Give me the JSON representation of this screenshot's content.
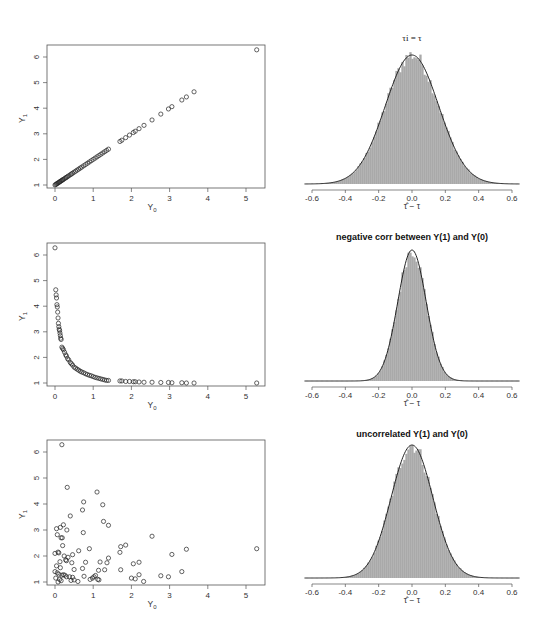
{
  "chart_data": [
    {
      "id": "scatter-identical",
      "type": "scatter",
      "title": "",
      "xlabel": "Y0",
      "ylabel": "Y1",
      "xlim": [
        -0.2,
        5.5
      ],
      "ylim": [
        0.85,
        6.4
      ],
      "xticks": [
        0,
        1,
        2,
        3,
        4,
        5
      ],
      "yticks": [
        1,
        2,
        3,
        4,
        5,
        6
      ],
      "relation": "Y1 = Y0 + 1",
      "x": [
        0.0,
        0.02,
        0.04,
        0.06,
        0.08,
        0.1,
        0.12,
        0.14,
        0.16,
        0.18,
        0.2,
        0.22,
        0.25,
        0.28,
        0.3,
        0.33,
        0.36,
        0.4,
        0.43,
        0.46,
        0.5,
        0.54,
        0.58,
        0.62,
        0.66,
        0.7,
        0.75,
        0.8,
        0.85,
        0.9,
        0.95,
        1.0,
        1.05,
        1.1,
        1.15,
        1.2,
        1.25,
        1.3,
        1.35,
        1.4,
        1.7,
        1.75,
        1.85,
        1.95,
        2.05,
        2.1,
        2.2,
        2.33,
        2.54,
        2.77,
        2.97,
        3.06,
        3.32,
        3.44,
        3.64,
        5.28
      ],
      "y": [
        1.0,
        1.02,
        1.04,
        1.06,
        1.08,
        1.1,
        1.12,
        1.14,
        1.16,
        1.18,
        1.2,
        1.22,
        1.25,
        1.28,
        1.3,
        1.33,
        1.36,
        1.4,
        1.43,
        1.46,
        1.5,
        1.54,
        1.58,
        1.62,
        1.66,
        1.7,
        1.75,
        1.8,
        1.85,
        1.9,
        1.95,
        2.0,
        2.05,
        2.1,
        2.15,
        2.2,
        2.25,
        2.3,
        2.35,
        2.4,
        2.7,
        2.75,
        2.85,
        2.95,
        3.05,
        3.1,
        3.2,
        3.33,
        3.54,
        3.77,
        3.97,
        4.06,
        4.32,
        4.44,
        4.64,
        6.28
      ]
    },
    {
      "id": "hist-identical",
      "type": "histogram",
      "title": "τi = τ",
      "xlabel": "τ̂ − τ",
      "ylabel": "",
      "xlim": [
        -0.65,
        0.65
      ],
      "xticks": [
        -0.6,
        -0.4,
        -0.2,
        0.0,
        0.2,
        0.4,
        0.6
      ],
      "overlay": "normal density curve",
      "mean": 0.0,
      "sd": 0.16
    },
    {
      "id": "scatter-negative",
      "type": "scatter",
      "title": "",
      "xlabel": "Y0",
      "ylabel": "Y1",
      "xlim": [
        -0.2,
        5.5
      ],
      "ylim": [
        0.85,
        6.4
      ],
      "xticks": [
        0,
        1,
        2,
        3,
        4,
        5
      ],
      "yticks": [
        1,
        2,
        3,
        4,
        5,
        6
      ],
      "relation": "decreasing (inverse-type) relationship",
      "x": [
        0.0,
        0.02,
        0.03,
        0.04,
        0.05,
        0.06,
        0.07,
        0.08,
        0.09,
        0.1,
        0.11,
        0.12,
        0.13,
        0.14,
        0.15,
        0.16,
        0.18,
        0.2,
        0.22,
        0.25,
        0.28,
        0.3,
        0.33,
        0.36,
        0.4,
        0.43,
        0.46,
        0.5,
        0.54,
        0.58,
        0.62,
        0.66,
        0.7,
        0.75,
        0.8,
        0.85,
        0.9,
        0.95,
        1.0,
        1.05,
        1.1,
        1.15,
        1.2,
        1.25,
        1.3,
        1.35,
        1.4,
        1.7,
        1.75,
        1.85,
        1.95,
        2.05,
        2.1,
        2.2,
        2.33,
        2.54,
        2.77,
        2.97,
        3.06,
        3.32,
        3.44,
        3.64,
        5.28
      ],
      "y": [
        6.28,
        4.64,
        4.44,
        4.32,
        4.06,
        3.97,
        3.77,
        3.54,
        3.33,
        3.2,
        3.1,
        3.05,
        2.95,
        2.85,
        2.75,
        2.7,
        2.4,
        2.35,
        2.3,
        2.2,
        2.1,
        2.05,
        1.95,
        1.9,
        1.8,
        1.75,
        1.7,
        1.62,
        1.58,
        1.54,
        1.5,
        1.46,
        1.43,
        1.4,
        1.36,
        1.33,
        1.3,
        1.28,
        1.25,
        1.22,
        1.2,
        1.18,
        1.16,
        1.14,
        1.12,
        1.1,
        1.1,
        1.08,
        1.08,
        1.06,
        1.06,
        1.05,
        1.05,
        1.04,
        1.03,
        1.03,
        1.02,
        1.02,
        1.01,
        1.01,
        1.0,
        1.0,
        1.0
      ]
    },
    {
      "id": "hist-negative",
      "type": "histogram",
      "title": "negative corr between Y(1) and Y(0)",
      "xlabel": "τ̂ − τ",
      "ylabel": "",
      "xlim": [
        -0.65,
        0.65
      ],
      "xticks": [
        -0.6,
        -0.4,
        -0.2,
        0.0,
        0.2,
        0.4,
        0.6
      ],
      "overlay": "normal density curve",
      "mean": 0.0,
      "sd": 0.085
    },
    {
      "id": "scatter-uncorrelated",
      "type": "scatter",
      "title": "",
      "xlabel": "Y0",
      "ylabel": "Y1",
      "xlim": [
        -0.2,
        5.5
      ],
      "ylim": [
        0.85,
        6.4
      ],
      "xticks": [
        0,
        1,
        2,
        3,
        4,
        5
      ],
      "yticks": [
        1,
        2,
        3,
        4,
        5,
        6
      ],
      "relation": "no correlation",
      "x": [
        0.18,
        0.32,
        1.1,
        0.75,
        1.25,
        0.72,
        0.4,
        1.27,
        1.4,
        0.04,
        0.14,
        0.22,
        0.31,
        0.74,
        0.06,
        0.16,
        0.19,
        2.54,
        1.85,
        1.72,
        0.2,
        0.24,
        0.9,
        0.0,
        0.08,
        0.1,
        0.62,
        1.7,
        1.4,
        0.28,
        0.46,
        2.05,
        2.2,
        3.06,
        3.44,
        5.28,
        0.13,
        0.3,
        0.34,
        0.44,
        0.8,
        1.18,
        1.36,
        1.72,
        0.04,
        0.14,
        0.5,
        0.72,
        1.3,
        1.14,
        0.0,
        0.06,
        0.1,
        0.18,
        0.26,
        0.38,
        0.46,
        0.76,
        1.02,
        1.12,
        2.0,
        2.1,
        2.2,
        2.77,
        2.97,
        3.32,
        0.02,
        0.12,
        0.22,
        0.3,
        0.42,
        0.5,
        0.6,
        0.92,
        0.98,
        1.06,
        1.15,
        0.16,
        0.08,
        2.32
      ],
      "y": [
        6.28,
        4.64,
        4.46,
        4.08,
        3.97,
        3.77,
        3.54,
        3.33,
        3.18,
        3.05,
        3.1,
        3.2,
        3.0,
        2.9,
        2.82,
        2.7,
        2.7,
        2.76,
        2.42,
        2.36,
        2.4,
        2.0,
        2.28,
        2.1,
        2.15,
        2.12,
        2.2,
        2.14,
        1.92,
        1.85,
        2.05,
        1.7,
        1.76,
        2.06,
        2.26,
        2.28,
        1.78,
        1.82,
        1.95,
        1.74,
        1.76,
        1.77,
        1.74,
        1.47,
        1.62,
        1.55,
        1.48,
        1.52,
        1.47,
        1.45,
        1.4,
        1.35,
        1.3,
        1.26,
        1.26,
        1.2,
        1.18,
        1.22,
        1.2,
        1.1,
        1.15,
        1.12,
        1.28,
        1.24,
        1.2,
        1.4,
        1.15,
        1.1,
        1.28,
        1.2,
        1.06,
        1.08,
        1.02,
        1.1,
        1.15,
        1.25,
        1.08,
        1.05,
        1.0,
        1.02
      ]
    },
    {
      "id": "hist-uncorrelated",
      "type": "histogram",
      "title": "uncorrelated Y(1) and Y(0)",
      "xlabel": "τ̂ − τ",
      "ylabel": "",
      "xlim": [
        -0.65,
        0.65
      ],
      "xticks": [
        -0.6,
        -0.4,
        -0.2,
        0.0,
        0.2,
        0.4,
        0.6
      ],
      "overlay": "normal density curve",
      "mean": 0.0,
      "sd": 0.125
    }
  ],
  "colors": {
    "bars": "#a9a9a9",
    "curve": "#222222",
    "points": "#222222",
    "axis": "#555555"
  }
}
